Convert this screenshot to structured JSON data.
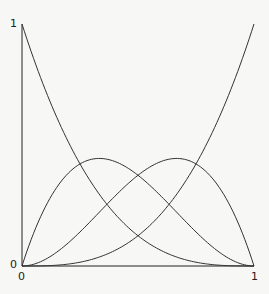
{
  "chart_data": {
    "type": "line",
    "title": "",
    "xlabel": "",
    "ylabel": "",
    "xlim": [
      0,
      1
    ],
    "ylim": [
      0,
      1
    ],
    "x_ticks": [
      "0",
      "1"
    ],
    "y_ticks": [
      "0",
      "1"
    ],
    "grid": false,
    "legend": null,
    "x": [
      0,
      0.1,
      0.2,
      0.3,
      0.4,
      0.5,
      0.6,
      0.7,
      0.8,
      0.9,
      1.0
    ],
    "series": [
      {
        "name": "(1-t)^3",
        "values": [
          1,
          0.729,
          0.512,
          0.343,
          0.216,
          0.125,
          0.064,
          0.027,
          0.008,
          0.001,
          0
        ]
      },
      {
        "name": "3t(1-t)^2",
        "values": [
          0,
          0.243,
          0.384,
          0.441,
          0.432,
          0.375,
          0.288,
          0.189,
          0.096,
          0.027,
          0
        ]
      },
      {
        "name": "3t^2(1-t)",
        "values": [
          0,
          0.027,
          0.096,
          0.189,
          0.288,
          0.375,
          0.432,
          0.441,
          0.384,
          0.243,
          0
        ]
      },
      {
        "name": "t^3",
        "values": [
          0,
          0.001,
          0.008,
          0.027,
          0.064,
          0.125,
          0.216,
          0.343,
          0.512,
          0.729,
          1
        ]
      }
    ]
  },
  "labels": {
    "y_top": "1",
    "y_bottom": "0",
    "x_left": "0",
    "x_right": "1"
  }
}
